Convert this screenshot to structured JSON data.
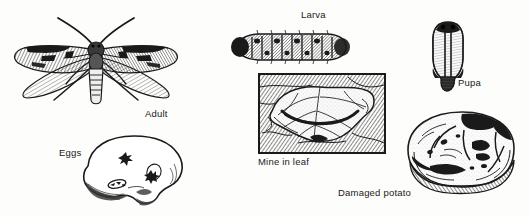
{
  "figure": {
    "background_color": "#fdfdfc",
    "ink_color": "#1a1a1a",
    "width": 529,
    "height": 216
  },
  "labels": {
    "adult": "Adult",
    "eggs": "Eggs",
    "larva": "Larva",
    "mine_in_leaf": "Mine in leaf",
    "pupa": "Pupa",
    "damaged_potato": "Damaged potato"
  },
  "illustrations": [
    {
      "name": "adult-moth",
      "label": "Adult",
      "x": 13,
      "y": 18,
      "width": 162,
      "height": 94
    },
    {
      "name": "eggs-on-potato",
      "label": "Eggs",
      "x": 70,
      "y": 132,
      "width": 120,
      "height": 78
    },
    {
      "name": "larva-caterpillar",
      "label": "Larva",
      "x": 232,
      "y": 33,
      "width": 118,
      "height": 28
    },
    {
      "name": "mine-in-leaf-panel",
      "label": "Mine in leaf",
      "x": 259,
      "y": 74,
      "width": 126,
      "height": 79
    },
    {
      "name": "pupa",
      "label": "Pupa",
      "x": 429,
      "y": 21,
      "width": 37,
      "height": 68
    },
    {
      "name": "damaged-potato",
      "label": "Damaged potato",
      "x": 404,
      "y": 110,
      "width": 113,
      "height": 82
    }
  ]
}
